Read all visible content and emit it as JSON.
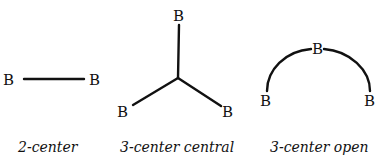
{
  "diagram": {
    "atom_symbol": "B",
    "panels": [
      {
        "id": "two-center",
        "label": "2-center",
        "atoms": [
          "B",
          "B"
        ]
      },
      {
        "id": "three-center-central",
        "label": "3-center central",
        "atoms": [
          "B",
          "B",
          "B"
        ]
      },
      {
        "id": "three-center-open",
        "label": "3-center open",
        "atoms": [
          "B",
          "B",
          "B"
        ]
      }
    ]
  }
}
